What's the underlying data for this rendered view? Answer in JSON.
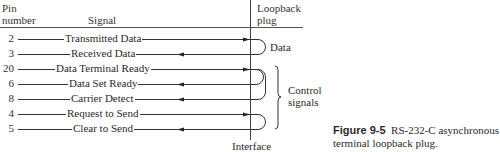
{
  "header": {
    "pin_label_line1": "Pin",
    "pin_label_line2": "number",
    "signal_label": "Signal",
    "plug_label_line1": "Loopback",
    "plug_label_line2": "plug"
  },
  "rows": [
    {
      "pin": "2",
      "signal": "Transmitted Data",
      "direction": "out"
    },
    {
      "pin": "3",
      "signal": "Received Data",
      "direction": "in"
    },
    {
      "pin": "20",
      "signal": "Data Terminal Ready",
      "direction": "out"
    },
    {
      "pin": "6",
      "signal": "Data Set Ready",
      "direction": "in"
    },
    {
      "pin": "8",
      "signal": "Carrier Detect",
      "direction": "in"
    },
    {
      "pin": "4",
      "signal": "Request to Send",
      "direction": "out"
    },
    {
      "pin": "5",
      "signal": "Clear to Send",
      "direction": "in"
    }
  ],
  "groups": {
    "data_label": "Data",
    "control_label_line1": "Control",
    "control_label_line2": "signals"
  },
  "interface_label": "Interface",
  "caption": {
    "figure_number": "Figure 9-5",
    "text_line1": "RS-232-C asynchronous",
    "text_line2": "terminal loopback plug."
  }
}
